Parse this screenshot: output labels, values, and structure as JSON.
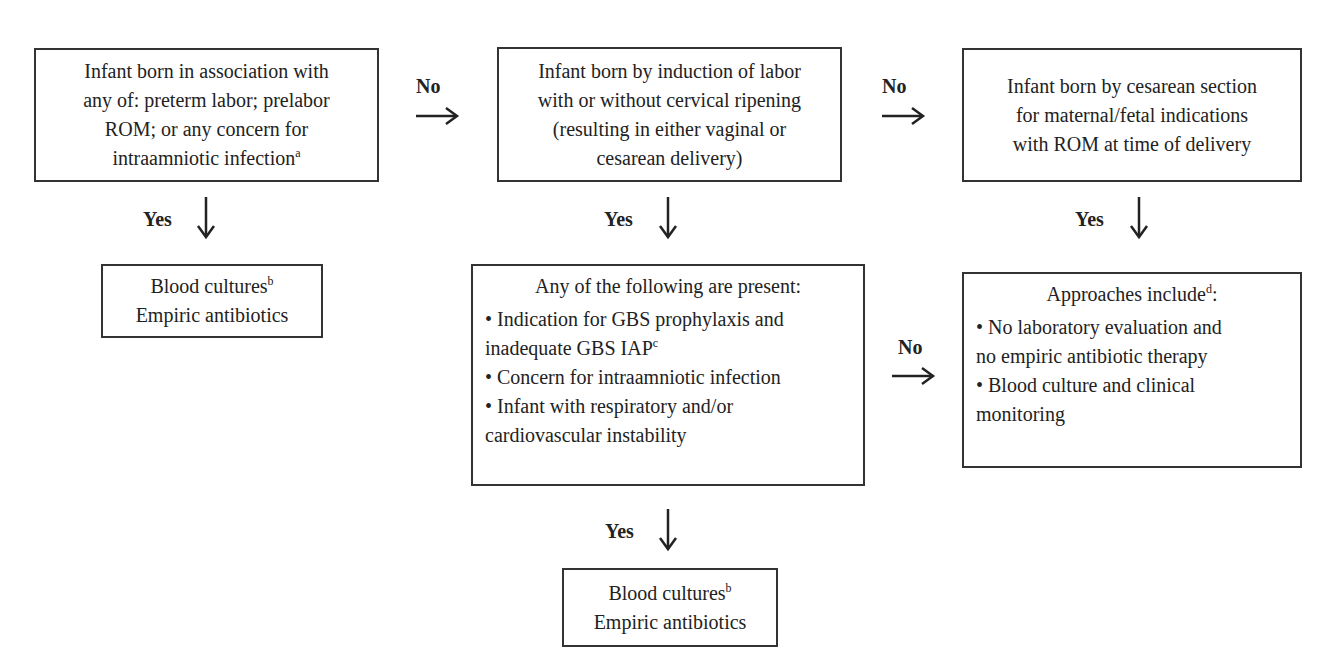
{
  "diagram": {
    "type": "flowchart",
    "nodes": {
      "n1": {
        "lines": [
          "Infant born in association with",
          "any of: preterm labor; prelabor",
          "ROM; or any concern for",
          "intraamniotic infection"
        ],
        "footnote": "a"
      },
      "n2": {
        "lines": [
          "Infant born by induction of labor",
          "with or without cervical ripening",
          "(resulting in either vaginal or",
          "cesarean delivery)"
        ]
      },
      "n3": {
        "lines": [
          "Infant born by cesarean section",
          "for maternal/fetal indications",
          "with ROM at time of delivery"
        ]
      },
      "n1_yes": {
        "line1": "Blood cultures",
        "line1_footnote": "b",
        "line2": "Empiric antibiotics"
      },
      "n2_yes": {
        "heading": "Any of the following are present:",
        "items": [
          {
            "bullet": "•",
            "line1": "Indication for GBS prophylaxis and",
            "line2": "inadequate GBS IAP",
            "footnote": "c"
          },
          {
            "bullet": "•",
            "line1": "Concern for intraamniotic infection"
          },
          {
            "bullet": "•",
            "line1": "Infant with respiratory and/or",
            "line2": "cardiovascular instability"
          }
        ]
      },
      "n2_yes_yes": {
        "line1": "Blood cultures",
        "line1_footnote": "b",
        "line2": "Empiric antibiotics"
      },
      "n3_yes": {
        "heading": "Approaches include",
        "heading_footnote": "d",
        "heading_suffix": ":",
        "items": [
          {
            "bullet": "•",
            "line1": "No laboratory evaluation and",
            "line2": "no empiric antibiotic therapy"
          },
          {
            "bullet": "•",
            "line1": "Blood culture and clinical",
            "line2": "monitoring"
          }
        ]
      }
    },
    "edges": [
      {
        "from": "n1",
        "to": "n2",
        "label": "No"
      },
      {
        "from": "n2",
        "to": "n3",
        "label": "No"
      },
      {
        "from": "n1",
        "to": "n1_yes",
        "label": "Yes"
      },
      {
        "from": "n2",
        "to": "n2_yes",
        "label": "Yes"
      },
      {
        "from": "n3",
        "to": "n3_yes",
        "label": "Yes"
      },
      {
        "from": "n2_yes",
        "to": "n3_yes",
        "label": "No"
      },
      {
        "from": "n2_yes",
        "to": "n2_yes_yes",
        "label": "Yes"
      }
    ],
    "labels": {
      "no": "No",
      "yes": "Yes"
    },
    "colors": {
      "border": "#333333",
      "text": "#222222",
      "background": "#ffffff"
    }
  }
}
